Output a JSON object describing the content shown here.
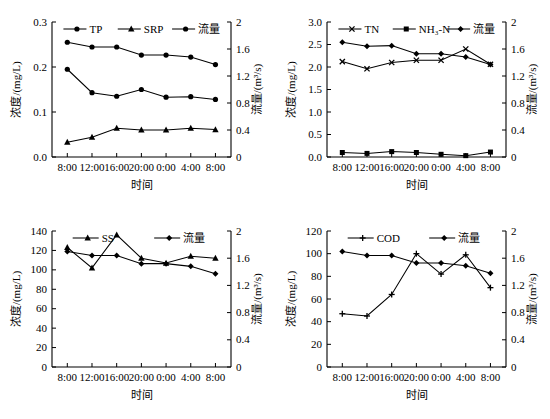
{
  "figure": {
    "xlabel": "时间",
    "ylabel_left": "浓度/(mg/L)",
    "ylabel_right": "流量/(m³/s)",
    "xticks": [
      "8:00",
      "12:00",
      "16:00",
      "20:00",
      "0:00",
      "4:00",
      "8:00"
    ],
    "flow_name": "流量",
    "flow_ticks": [
      "0",
      "0.4",
      "0.8",
      "1.2",
      "1.6",
      "2"
    ],
    "flow_range": [
      0,
      2
    ]
  },
  "chart_data": [
    {
      "id": "panel-tp-srp",
      "type": "line",
      "position": "top-left",
      "title": "",
      "xlabel": "时间",
      "ylabel": "浓度/(mg/L)",
      "ylabel_right": "流量/(m³/s)",
      "x": [
        "8:00",
        "12:00",
        "16:00",
        "20:00",
        "0:00",
        "4:00",
        "8:00"
      ],
      "ylim": [
        0,
        0.3
      ],
      "yticks": [
        "0.0",
        "0.1",
        "0.2",
        "0.3"
      ],
      "ylim_right": [
        0,
        2
      ],
      "yticks_right": [
        "0",
        "0.4",
        "0.8",
        "1.2",
        "1.6",
        "2"
      ],
      "grid": false,
      "legend_position": "top",
      "series": [
        {
          "name": "TP",
          "marker": "circle",
          "axis": "left",
          "values": [
            0.195,
            0.143,
            0.135,
            0.15,
            0.133,
            0.134,
            0.128
          ]
        },
        {
          "name": "SRP",
          "marker": "triangle",
          "axis": "left",
          "values": [
            0.033,
            0.044,
            0.064,
            0.06,
            0.06,
            0.064,
            0.061
          ]
        },
        {
          "name": "流量",
          "marker": "circle",
          "axis": "right",
          "values": [
            1.7,
            1.63,
            1.63,
            1.51,
            1.51,
            1.48,
            1.37
          ]
        }
      ]
    },
    {
      "id": "panel-tn-nh3n",
      "type": "line",
      "position": "top-right",
      "title": "",
      "xlabel": "时间",
      "ylabel": "浓度/(mg/L)",
      "ylabel_right": "流量/(m³/s)",
      "x": [
        "8:00",
        "12:00",
        "16:00",
        "20:00",
        "0:00",
        "4:00",
        "8:00"
      ],
      "ylim": [
        0,
        3.0
      ],
      "yticks": [
        "0.0",
        "0.5",
        "1.0",
        "1.5",
        "2.0",
        "2.5",
        "3.0"
      ],
      "ylim_right": [
        0,
        2
      ],
      "yticks_right": [
        "0",
        "0.4",
        "0.8",
        "1.2",
        "1.6",
        "2"
      ],
      "grid": false,
      "legend_position": "top",
      "series": [
        {
          "name": "TN",
          "marker": "x",
          "axis": "left",
          "values": [
            2.12,
            1.96,
            2.1,
            2.15,
            2.15,
            2.4,
            2.06
          ]
        },
        {
          "name": "NH₃-N",
          "marker": "square",
          "axis": "left",
          "values": [
            0.1,
            0.08,
            0.12,
            0.1,
            0.06,
            0.03,
            0.11
          ]
        },
        {
          "name": "流量",
          "marker": "diamond",
          "axis": "right",
          "values": [
            1.7,
            1.64,
            1.65,
            1.53,
            1.53,
            1.48,
            1.37
          ]
        }
      ]
    },
    {
      "id": "panel-ss",
      "type": "line",
      "position": "bottom-left",
      "title": "",
      "xlabel": "时间",
      "ylabel": "浓度/(mg/L)",
      "ylabel_right": "流量/(m³/s)",
      "x": [
        "8:00",
        "12:00",
        "16:00",
        "20:00",
        "0:00",
        "4:00",
        "8:00"
      ],
      "ylim": [
        0,
        140
      ],
      "yticks": [
        "0",
        "20",
        "40",
        "60",
        "80",
        "100",
        "120",
        "140"
      ],
      "ylim_right": [
        0,
        2
      ],
      "yticks_right": [
        "0",
        "0.4",
        "0.8",
        "1.2",
        "1.6",
        "2"
      ],
      "grid": false,
      "legend_position": "top",
      "series": [
        {
          "name": "SS",
          "marker": "triangle",
          "axis": "left",
          "values": [
            123,
            102,
            136,
            112,
            107,
            114,
            112
          ]
        },
        {
          "name": "流量",
          "marker": "diamond",
          "axis": "right",
          "values": [
            1.7,
            1.64,
            1.64,
            1.52,
            1.52,
            1.48,
            1.37
          ]
        }
      ]
    },
    {
      "id": "panel-cod",
      "type": "line",
      "position": "bottom-right",
      "title": "",
      "xlabel": "时间",
      "ylabel": "浓度/(mg/L)",
      "ylabel_right": "流量/(m³/s)",
      "x": [
        "8:00",
        "12:00",
        "16:00",
        "20:00",
        "0:00",
        "4:00",
        "8:00"
      ],
      "ylim": [
        0,
        120
      ],
      "yticks": [
        "0",
        "20",
        "40",
        "60",
        "80",
        "100",
        "120"
      ],
      "ylim_right": [
        0,
        2
      ],
      "yticks_right": [
        "0",
        "0.4",
        "0.8",
        "1.2",
        "1.6",
        "2"
      ],
      "grid": false,
      "legend_position": "top",
      "series": [
        {
          "name": "COD",
          "marker": "plus",
          "axis": "left",
          "values": [
            47,
            45,
            64,
            100,
            82,
            99,
            70
          ]
        },
        {
          "name": "流量",
          "marker": "diamond",
          "axis": "right",
          "values": [
            1.7,
            1.64,
            1.64,
            1.53,
            1.53,
            1.49,
            1.38
          ]
        }
      ]
    }
  ]
}
